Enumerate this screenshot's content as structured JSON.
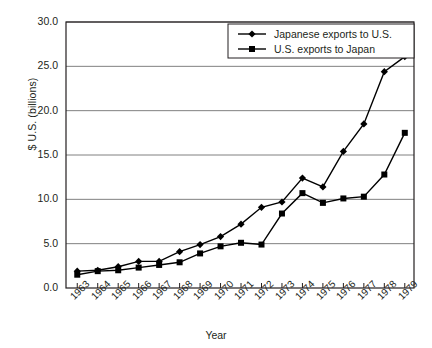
{
  "chart_data": {
    "type": "line",
    "title": "",
    "xlabel": "Year",
    "ylabel": "$ U.S. (billions)",
    "x": [
      1963,
      1964,
      1965,
      1966,
      1967,
      1968,
      1969,
      1970,
      1971,
      1972,
      1973,
      1974,
      1975,
      1976,
      1977,
      1978,
      1979
    ],
    "xtick_labels": [
      "1963",
      "1964",
      "1965",
      "1966",
      "1967",
      "1968",
      "1969",
      "1970",
      "1971",
      "1972",
      "1973",
      "1974",
      "1975",
      "1976",
      "1977",
      "1978",
      "1979"
    ],
    "ytick_labels": [
      "0.0",
      "5.0",
      "10.0",
      "15.0",
      "20.0",
      "25.0",
      "30.0"
    ],
    "ytick_values": [
      0,
      5,
      10,
      15,
      20,
      25,
      30
    ],
    "ylim": [
      0,
      30
    ],
    "grid": "horizontal",
    "legend_position": "top-right",
    "series": [
      {
        "name": "Japanese exports to U.S.",
        "marker": "diamond",
        "color": "#000000",
        "values": [
          1.9,
          2.0,
          2.4,
          3.0,
          3.0,
          4.1,
          4.9,
          5.8,
          7.2,
          9.1,
          9.7,
          12.4,
          11.4,
          15.4,
          18.5,
          24.4,
          26.1
        ]
      },
      {
        "name": "U.S. exports to Japan",
        "marker": "square",
        "color": "#000000",
        "values": [
          1.5,
          1.9,
          2.0,
          2.3,
          2.6,
          2.9,
          3.9,
          4.7,
          5.1,
          4.9,
          8.4,
          10.7,
          9.6,
          10.1,
          10.3,
          12.8,
          17.5
        ]
      }
    ]
  }
}
